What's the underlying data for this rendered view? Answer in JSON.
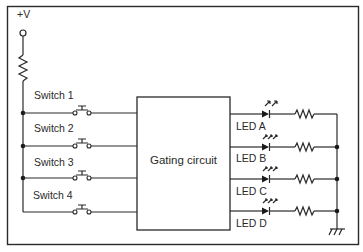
{
  "diagram": {
    "type": "circuit-schematic",
    "supply": {
      "label": "+V"
    },
    "switches": [
      {
        "label": "Switch 1"
      },
      {
        "label": "Switch 2"
      },
      {
        "label": "Switch 3"
      },
      {
        "label": "Switch 4"
      }
    ],
    "gating_block": {
      "label": "Gating circuit"
    },
    "leds": [
      {
        "label": "LED A"
      },
      {
        "label": "LED B"
      },
      {
        "label": "LED C"
      },
      {
        "label": "LED D"
      }
    ],
    "ground": {
      "symbol": "ground"
    },
    "colors": {
      "line": "#2a2a2a",
      "background": "#ffffff"
    }
  }
}
